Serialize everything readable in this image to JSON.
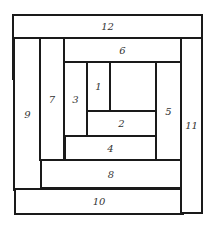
{
  "diagram": {
    "type": "log-cabin quilt block",
    "pieces": [
      {
        "id": "1",
        "label": "1"
      },
      {
        "id": "2",
        "label": "2"
      },
      {
        "id": "3",
        "label": "3"
      },
      {
        "id": "4",
        "label": "4"
      },
      {
        "id": "5",
        "label": "5"
      },
      {
        "id": "6",
        "label": "6"
      },
      {
        "id": "7",
        "label": "7"
      },
      {
        "id": "8",
        "label": "8"
      },
      {
        "id": "9",
        "label": "9"
      },
      {
        "id": "10",
        "label": "10"
      },
      {
        "id": "11",
        "label": "11"
      },
      {
        "id": "12",
        "label": "12"
      },
      {
        "id": "center",
        "label": ""
      }
    ]
  }
}
